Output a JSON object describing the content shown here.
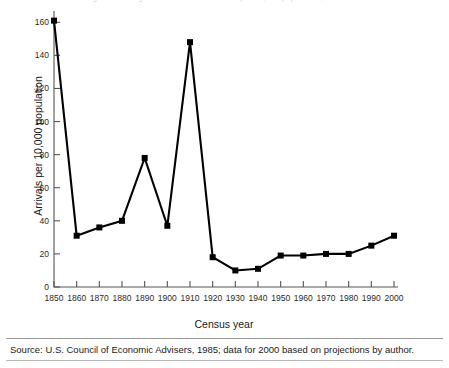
{
  "figure": {
    "clipped_title": "Figure 1. Immigration to the United States per 10,000 population, 1850-2000",
    "source_note": "Source: U.S. Council of Economic Advisers, 1985; data for 2000 based on projections by author."
  },
  "chart_data": {
    "type": "line",
    "title": "",
    "xlabel": "Census year",
    "ylabel": "Arrivals per 10,000 population",
    "x": [
      1850,
      1860,
      1870,
      1880,
      1890,
      1900,
      1910,
      1920,
      1930,
      1940,
      1950,
      1960,
      1970,
      1980,
      1990,
      2000
    ],
    "values": [
      161,
      31,
      36,
      40,
      78,
      37,
      148,
      18,
      10,
      11,
      19,
      19,
      20,
      20,
      25,
      31
    ],
    "xlim": [
      1850,
      2000
    ],
    "ylim": [
      0,
      165
    ],
    "xticks": [
      1850,
      1860,
      1870,
      1880,
      1890,
      1900,
      1910,
      1920,
      1930,
      1940,
      1950,
      1960,
      1970,
      1980,
      1990,
      2000
    ],
    "xtick_labels": [
      "1850",
      "1860",
      "1870",
      "1880",
      "1890",
      "1900",
      "1910",
      "1920",
      "1930",
      "1940",
      "1950",
      "1960",
      "1970",
      "1980",
      "1990",
      "2000"
    ],
    "yticks": [
      0,
      20,
      40,
      60,
      80,
      100,
      120,
      140,
      160
    ],
    "ytick_labels": [
      "0",
      "20",
      "40",
      "60",
      "80",
      "100",
      "120",
      "140",
      "160"
    ],
    "grid": false,
    "legend": null,
    "marker": "square",
    "line_color": "#000000",
    "marker_color": "#000000"
  }
}
